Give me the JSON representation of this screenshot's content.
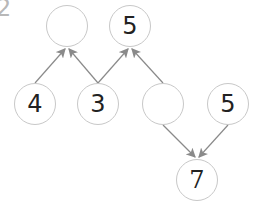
{
  "problem_number": "2",
  "nodes": [
    {
      "id": "top-left",
      "value": "",
      "cx": 67,
      "cy": 26
    },
    {
      "id": "top-right",
      "value": "5",
      "cx": 130,
      "cy": 26
    },
    {
      "id": "bottom-1",
      "value": "4",
      "cx": 35,
      "cy": 104
    },
    {
      "id": "bottom-2",
      "value": "3",
      "cx": 98,
      "cy": 104
    },
    {
      "id": "bottom-3",
      "value": "",
      "cx": 163,
      "cy": 104
    },
    {
      "id": "bottom-4",
      "value": "5",
      "cx": 228,
      "cy": 104
    },
    {
      "id": "result",
      "value": "7",
      "cx": 197,
      "cy": 180
    }
  ],
  "edges": [
    {
      "from": "bottom-1",
      "to": "top-left"
    },
    {
      "from": "bottom-2",
      "to": "top-left"
    },
    {
      "from": "bottom-2",
      "to": "top-right"
    },
    {
      "from": "bottom-3",
      "to": "top-right"
    },
    {
      "from": "bottom-3",
      "to": "result"
    },
    {
      "from": "bottom-4",
      "to": "result"
    }
  ],
  "colors": {
    "stroke": "#c8c8c8",
    "arrow": "#8a8a8a",
    "text": "#222222"
  }
}
